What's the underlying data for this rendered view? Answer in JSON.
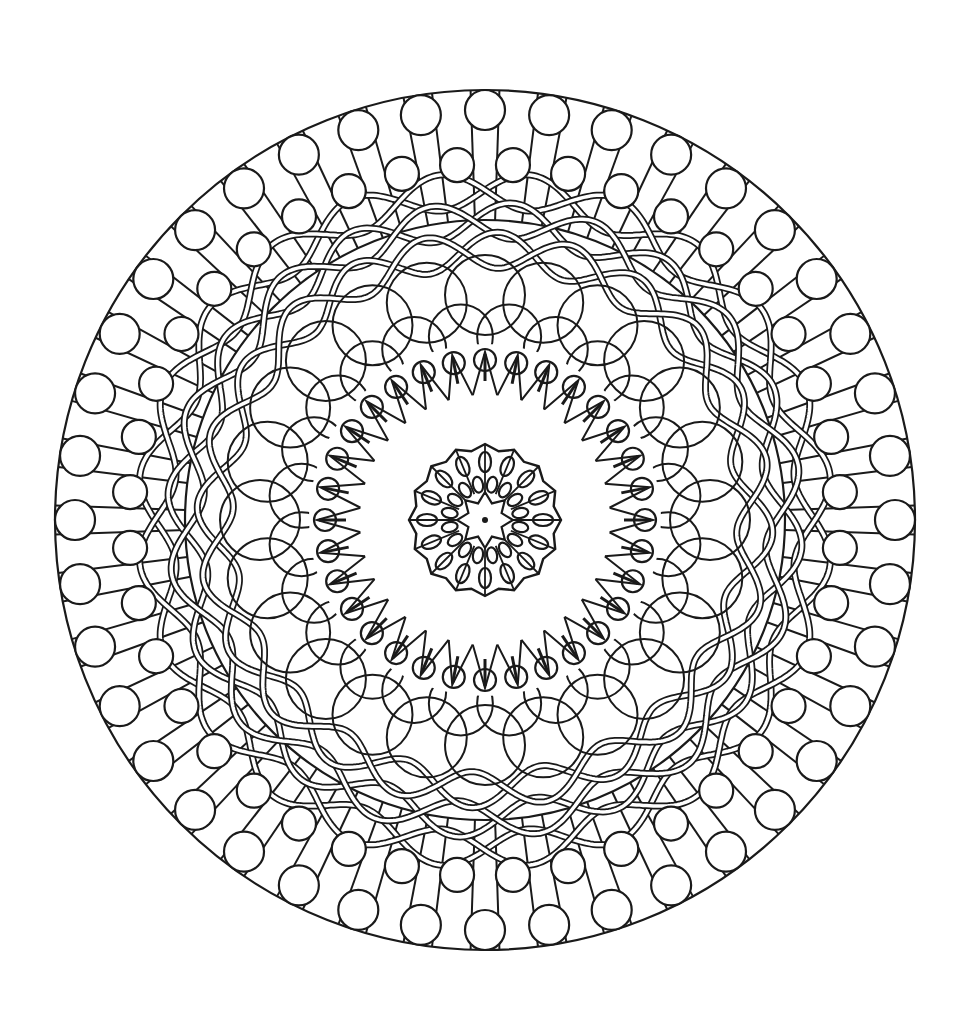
{
  "image": {
    "type": "mandala-coloring-page",
    "background": "#ffffff",
    "stroke": "#1a1a1a",
    "center": [
      485,
      520
    ],
    "rings": {
      "outer_rods": {
        "count": 40,
        "r_outer": 430,
        "r_inner": 300
      },
      "outer_large_circles": {
        "count": 40,
        "r": 410,
        "size": 20
      },
      "outer_small_circles": {
        "count": 40,
        "r": 356,
        "size": 17
      },
      "woven_bands": {
        "count": 3,
        "radii": [
          330,
          300,
          270
        ],
        "amplitude": 18,
        "lobes": 12,
        "gap": 4
      },
      "overlap_circles": {
        "count": 24,
        "r": 225,
        "size": 40
      },
      "overlap_circles_inner": {
        "count": 24,
        "r": 185,
        "size": 32
      },
      "spike_small_circles": {
        "count": 32,
        "r": 152,
        "size": 11
      },
      "spikes": {
        "count": 32,
        "r_outer": 168,
        "r_inner": 125
      },
      "inner_rosette": {
        "petals": 16,
        "r_outer": 76,
        "r_mid": 52,
        "r_inner": 28
      },
      "center_dot": {
        "size": 3
      }
    }
  }
}
